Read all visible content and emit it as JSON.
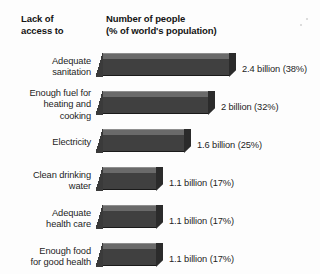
{
  "headers": {
    "left": "Lack of\naccess to",
    "right": "Number of people\n(% of world's population)"
  },
  "colors": {
    "bar_top": "#6a6a6a",
    "bar_front": "#404040",
    "bar_cap": "#2b2b2b",
    "background": "#fdfdfd",
    "text": "#1d1d1d"
  },
  "chart_data": {
    "type": "bar",
    "orientation": "horizontal",
    "title": "Number of people (% of world's population)",
    "xlabel": "Number of people (% of world's population)",
    "ylabel": "Lack of access to",
    "grid": false,
    "legend": "none",
    "xlim": [
      0,
      2.4
    ],
    "units": "billions of people",
    "categories": [
      "Adequate sanitation",
      "Enough fuel for heating and cooking",
      "Electricity",
      "Clean drinking water",
      "Adequate health care",
      "Enough food for good health"
    ],
    "values": [
      2.4,
      2,
      1.6,
      1.1,
      1.1,
      1.1
    ],
    "percentages": [
      38,
      32,
      25,
      17,
      17,
      17
    ],
    "data_labels": [
      "2.4 billion (38%)",
      "2 billion (32%)",
      "1.6 billion (25%)",
      "1.1 billion (17%)",
      "1.1 billion (17%)",
      "1.1 billion (17%)"
    ]
  },
  "rows": [
    {
      "label": "Adequate\nsanitation",
      "value_label": "2.4 billion (38%)",
      "bar_px": 140
    },
    {
      "label": "Enough fuel for\nheating and\ncooking",
      "value_label": "2 billion (32%)",
      "bar_px": 119
    },
    {
      "label": "Electricity",
      "value_label": "1.6 billion (25%)",
      "bar_px": 95
    },
    {
      "label": "Clean drinking\nwater",
      "value_label": "1.1 billion (17%)",
      "bar_px": 67
    },
    {
      "label": "Adequate\nhealth care",
      "value_label": "1.1 billion (17%)",
      "bar_px": 67
    },
    {
      "label": "Enough food\nfor good health",
      "value_label": "1.1 billion (17%)",
      "bar_px": 67
    }
  ]
}
